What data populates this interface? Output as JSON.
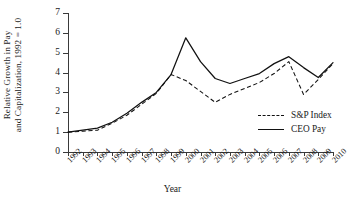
{
  "chart_data": {
    "type": "line",
    "title": "",
    "xlabel": "Year",
    "ylabel": "Relative Growth in Pay and Capitalization, 1992 = 1.0",
    "ylabel_lines": [
      "Relative Growth in Pay",
      "and Capitalization, 1992 = 1.0"
    ],
    "categories": [
      "1992",
      "1993",
      "1994",
      "1995",
      "1996",
      "1997",
      "1998",
      "1999",
      "2000",
      "2001",
      "2002",
      "2003",
      "2004",
      "2005",
      "2006",
      "2007",
      "2008",
      "2009",
      "2010"
    ],
    "ylim": [
      0,
      7
    ],
    "yticks": [
      0,
      1,
      2,
      3,
      4,
      5,
      6,
      7
    ],
    "grid": false,
    "legend_position": "inside-right",
    "series": [
      {
        "name": "S&P Index",
        "style": "dashed",
        "color": "#111111",
        "values": [
          1.0,
          1.05,
          1.1,
          1.45,
          1.85,
          2.4,
          2.95,
          3.9,
          3.6,
          3.05,
          2.5,
          2.9,
          3.2,
          3.5,
          3.95,
          4.55,
          2.9,
          3.65,
          4.45
        ]
      },
      {
        "name": "CEO Pay",
        "style": "solid",
        "color": "#111111",
        "values": [
          1.0,
          1.1,
          1.2,
          1.5,
          1.95,
          2.5,
          3.0,
          3.9,
          5.75,
          4.55,
          3.7,
          3.45,
          3.7,
          3.95,
          4.45,
          4.8,
          4.25,
          3.75,
          4.5
        ]
      }
    ]
  },
  "legend": {
    "items": [
      {
        "label": "S&P Index"
      },
      {
        "label": "CEO Pay"
      }
    ]
  }
}
